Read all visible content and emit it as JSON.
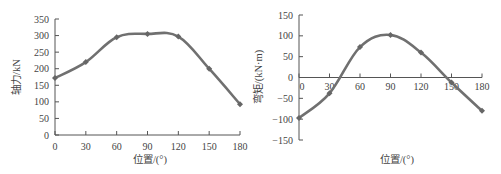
{
  "chart_data": [
    {
      "type": "line",
      "title": "",
      "xlabel": "位置/(°)",
      "ylabel": "轴力/kN",
      "x": [
        0,
        30,
        60,
        90,
        120,
        150,
        180
      ],
      "xticks": [
        "0",
        "30",
        "60",
        "90",
        "120",
        "150",
        "180"
      ],
      "yticks": [
        "0",
        "50",
        "100",
        "150",
        "200",
        "250",
        "300",
        "350"
      ],
      "ylim": [
        0,
        350
      ],
      "xlim": [
        0,
        180
      ],
      "grid": false,
      "series": [
        {
          "name": "轴力",
          "values": [
            172,
            220,
            295,
            305,
            297,
            200,
            93
          ],
          "color": "#707070"
        }
      ]
    },
    {
      "type": "line",
      "title": "",
      "xlabel": "位置/(°)",
      "ylabel": "弯矩/(kN·m)",
      "x": [
        0,
        30,
        60,
        90,
        120,
        150,
        180
      ],
      "xticks": [
        "0",
        "30",
        "60",
        "90",
        "120",
        "150",
        "180"
      ],
      "yticks": [
        "-150",
        "-100",
        "-50",
        "0",
        "50",
        "100",
        "150"
      ],
      "ylim": [
        -150,
        150
      ],
      "xlim": [
        0,
        180
      ],
      "grid": false,
      "series": [
        {
          "name": "弯矩",
          "values": [
            -97,
            -38,
            73,
            102,
            60,
            -12,
            -80
          ],
          "color": "#707070"
        }
      ]
    }
  ]
}
